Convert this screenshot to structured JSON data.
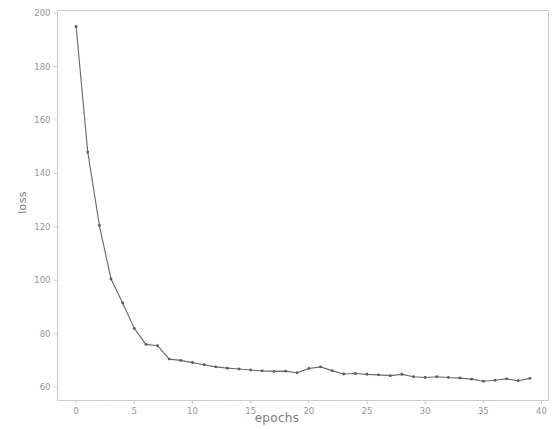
{
  "figure": {
    "background_color": "#ffffff",
    "line_color": "#4e545e",
    "marker_color": "#3f444c",
    "axis_color": "#bdbdbd",
    "tick_text_color": "#6f6f6f"
  },
  "chart_data": {
    "type": "line",
    "title": "",
    "xlabel": "epochs",
    "ylabel": "loss",
    "grid": false,
    "legend": false,
    "marker": "circle",
    "xlim": [
      -1.6,
      40.6
    ],
    "ylim": [
      55,
      201
    ],
    "xticks": [
      0,
      5,
      10,
      15,
      20,
      25,
      30,
      35,
      40
    ],
    "xtick_labels": [
      "0",
      "5",
      "10",
      "15",
      "20",
      "25",
      "30",
      "35",
      "40"
    ],
    "yticks": [
      60,
      80,
      100,
      120,
      140,
      160,
      180,
      200
    ],
    "ytick_labels": [
      "60",
      "80",
      "100",
      "120",
      "140",
      "160",
      "180",
      "200"
    ],
    "series": [
      {
        "name": "loss",
        "x": [
          0,
          1,
          2,
          3,
          4,
          5,
          6,
          7,
          8,
          9,
          10,
          11,
          12,
          13,
          14,
          15,
          16,
          17,
          18,
          19,
          20,
          21,
          22,
          23,
          24,
          25,
          26,
          27,
          28,
          29,
          30,
          31,
          32,
          33,
          34,
          35,
          36,
          37,
          38,
          39
        ],
        "values": [
          195.0,
          148.0,
          120.5,
          100.5,
          91.5,
          82.0,
          76.0,
          75.5,
          70.5,
          70.0,
          69.2,
          68.4,
          67.6,
          67.1,
          66.8,
          66.4,
          66.1,
          65.9,
          66.0,
          65.4,
          67.0,
          67.6,
          66.2,
          64.9,
          65.1,
          64.8,
          64.6,
          64.3,
          64.8,
          63.9,
          63.6,
          63.9,
          63.6,
          63.4,
          63.0,
          62.2,
          62.6,
          63.1,
          62.4,
          63.3
        ]
      }
    ]
  }
}
